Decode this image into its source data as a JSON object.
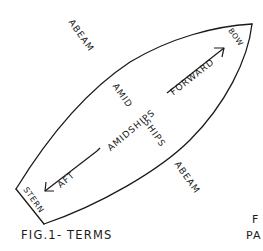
{
  "figure": {
    "caption": "FIG.1- TERMS",
    "hull_stroke_color": "#1a1a1a",
    "background": "#ffffff",
    "labels": {
      "abeam_top": "ABEAM",
      "abeam_bottom": "ABEAM",
      "amid": "AMID",
      "ships": "SHIPS",
      "amidships": "AMIDSHIPS",
      "forward": "FORWARD",
      "aft": "AFT",
      "bow": "BOW",
      "stern": "STERN"
    },
    "partial_text": {
      "line1": "F",
      "line2": "PA"
    }
  }
}
